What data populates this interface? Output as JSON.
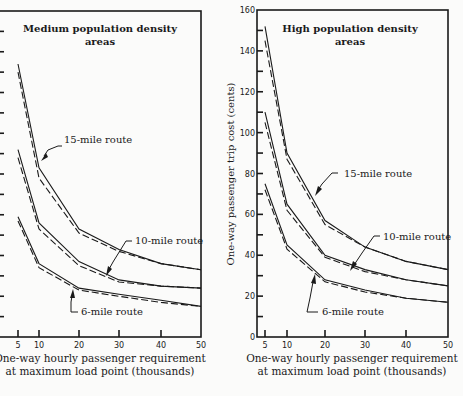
{
  "figure": {
    "ylabel": "One-way passenger trip cost (cents)",
    "xlabel_line1": "One-way hourly passenger requirement",
    "xlabel_line2": "at maximum load point (thousands)"
  },
  "chart_data": [
    {
      "type": "line",
      "title": "Medium population density areas",
      "title_line1": "Medium population density",
      "title_line2": "areas",
      "xlabel": "One-way hourly passenger requirement at maximum load point (thousands)",
      "ylabel": "One-way passenger trip cost (cents)",
      "x": [
        5,
        10,
        20,
        30,
        40,
        50
      ],
      "x_ticks": [
        5,
        10,
        20,
        30,
        40,
        50
      ],
      "ylim": [
        0,
        160
      ],
      "y_ticks_unlabeled": true,
      "grid": false,
      "series": [
        {
          "name": "15-mile route",
          "style": "solid",
          "values": [
            134,
            83,
            53,
            43,
            36,
            33
          ]
        },
        {
          "name": "15-mile route",
          "style": "dashed",
          "values": [
            130,
            78,
            51,
            42,
            36,
            33
          ]
        },
        {
          "name": "10-mile route",
          "style": "solid",
          "values": [
            92,
            56,
            37,
            28,
            25,
            24
          ]
        },
        {
          "name": "10-mile route",
          "style": "dashed",
          "values": [
            88,
            53,
            35,
            27,
            25,
            24
          ]
        },
        {
          "name": "6-mile route",
          "style": "solid",
          "values": [
            59,
            36,
            24,
            21,
            18,
            15
          ]
        },
        {
          "name": "6-mile route",
          "style": "dashed",
          "values": [
            57,
            34,
            23,
            20,
            17,
            15
          ]
        }
      ],
      "annotations": [
        "15-mile route",
        "10-mile route",
        "6-mile route"
      ]
    },
    {
      "type": "line",
      "title": "High population density areas",
      "title_line1": "High population density",
      "title_line2": "areas",
      "xlabel": "One-way hourly passenger requirement at maximum load point (thousands)",
      "ylabel": "One-way passenger trip cost (cents)",
      "x": [
        5,
        10,
        20,
        30,
        40,
        50
      ],
      "x_ticks": [
        5,
        10,
        20,
        30,
        40,
        50
      ],
      "ylim": [
        0,
        160
      ],
      "y_ticks": [
        0,
        20,
        40,
        60,
        80,
        100,
        120,
        140,
        160
      ],
      "grid": false,
      "series": [
        {
          "name": "15-mile route",
          "style": "solid",
          "values": [
            152,
            90,
            57,
            44,
            37,
            33
          ]
        },
        {
          "name": "15-mile route",
          "style": "dashed",
          "values": [
            145,
            87,
            55,
            44,
            37,
            33
          ]
        },
        {
          "name": "10-mile route",
          "style": "solid",
          "values": [
            110,
            65,
            40,
            33,
            28,
            25
          ]
        },
        {
          "name": "10-mile route",
          "style": "dashed",
          "values": [
            105,
            62,
            39,
            32,
            28,
            25
          ]
        },
        {
          "name": "6-mile route",
          "style": "solid",
          "values": [
            75,
            45,
            28,
            23,
            19,
            17
          ]
        },
        {
          "name": "6-mile route",
          "style": "dashed",
          "values": [
            72,
            43,
            27,
            22,
            19,
            17
          ]
        }
      ],
      "annotations": [
        "15-mile route",
        "10-mile route",
        "6-mile route"
      ]
    }
  ]
}
